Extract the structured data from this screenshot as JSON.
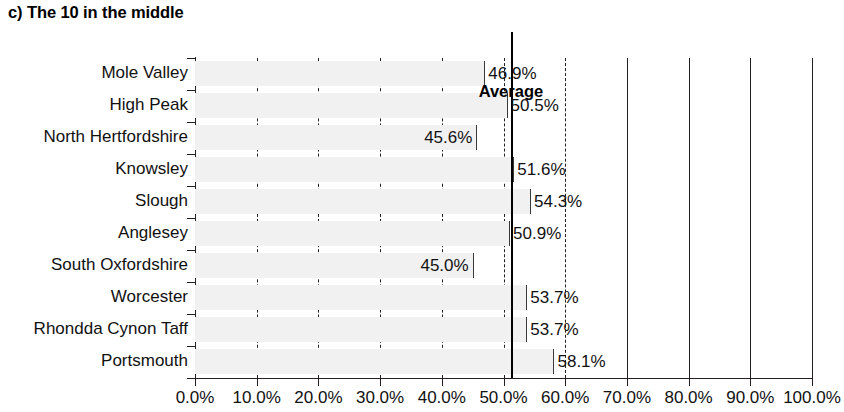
{
  "title": "c) The 10 in the middle",
  "average": {
    "label": "Average",
    "value": 51.2
  },
  "axis": {
    "x_ticks": [
      "0.0%",
      "10.0%",
      "20.0%",
      "30.0%",
      "40.0%",
      "50.0%",
      "60.0%",
      "70.0%",
      "80.0%",
      "90.0%",
      "100.0%"
    ],
    "x_tick_values": [
      0,
      10,
      20,
      30,
      40,
      50,
      60,
      70,
      80,
      90,
      100
    ],
    "xmin": 0,
    "xmax": 100
  },
  "colors": {
    "bar_fill": "#f1f1f1",
    "axis": "#231f20",
    "text": "#111111",
    "average_line": "#000000"
  },
  "rows": [
    {
      "label": "Mole Valley",
      "value": 46.9,
      "value_label": "46.9%",
      "label_side": "right"
    },
    {
      "label": "High Peak",
      "value": 50.5,
      "value_label": "50.5%",
      "label_side": "right"
    },
    {
      "label": "North Hertfordshire",
      "value": 45.6,
      "value_label": "45.6%",
      "label_side": "left"
    },
    {
      "label": "Knowsley",
      "value": 51.6,
      "value_label": "51.6%",
      "label_side": "right"
    },
    {
      "label": "Slough",
      "value": 54.3,
      "value_label": "54.3%",
      "label_side": "right"
    },
    {
      "label": "Anglesey",
      "value": 50.9,
      "value_label": "50.9%",
      "label_side": "right"
    },
    {
      "label": "South Oxfordshire",
      "value": 45.0,
      "value_label": "45.0%",
      "label_side": "left"
    },
    {
      "label": "Worcester",
      "value": 53.7,
      "value_label": "53.7%",
      "label_side": "right"
    },
    {
      "label": "Rhondda Cynon Taff",
      "value": 53.7,
      "value_label": "53.7%",
      "label_side": "right"
    },
    {
      "label": "Portsmouth",
      "value": 58.1,
      "value_label": "58.1%",
      "label_side": "right"
    }
  ],
  "chart_data": {
    "type": "bar",
    "orientation": "horizontal",
    "title": "c) The 10 in the middle",
    "xlabel": "",
    "ylabel": "",
    "xlim": [
      0,
      100
    ],
    "grid": true,
    "legend": null,
    "categories": [
      "Mole Valley",
      "High Peak",
      "North Hertfordshire",
      "Knowsley",
      "Slough",
      "Anglesey",
      "South Oxfordshire",
      "Worcester",
      "Rhondda Cynon Taff",
      "Portsmouth"
    ],
    "values": [
      46.9,
      50.5,
      45.6,
      51.6,
      54.3,
      50.9,
      45.0,
      53.7,
      53.7,
      58.1
    ],
    "data_labels": [
      "46.9%",
      "50.5%",
      "45.6%",
      "51.6%",
      "54.3%",
      "50.9%",
      "45.0%",
      "53.7%",
      "53.7%",
      "58.1%"
    ],
    "xtick_labels": [
      "0.0%",
      "10.0%",
      "20.0%",
      "30.0%",
      "40.0%",
      "50.0%",
      "60.0%",
      "70.0%",
      "80.0%",
      "90.0%",
      "100.0%"
    ],
    "xticks": [
      0,
      10,
      20,
      30,
      40,
      50,
      60,
      70,
      80,
      90,
      100
    ],
    "annotations": [
      {
        "text": "Average",
        "type": "vline",
        "x": 51.2
      }
    ]
  }
}
